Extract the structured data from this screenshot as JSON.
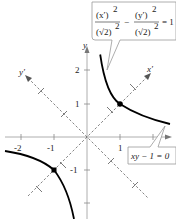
{
  "figure": {
    "type": "graph of rotated hyperbola",
    "axes": {
      "x_label": "x",
      "y_label": "y",
      "x_ticks": [
        "-2",
        "-1",
        "1",
        "2"
      ],
      "y_ticks": [
        "2",
        "1",
        "-1"
      ],
      "rotated_x_label": "x′",
      "rotated_y_label": "y′"
    },
    "callouts": {
      "top": {
        "num1": "(x′)",
        "num1_exp": "2",
        "den1": "(√2)",
        "den1_exp": "2",
        "minus": "−",
        "num2": "(y′)",
        "num2_exp": "2",
        "den2": "(√2)",
        "den2_exp": "2",
        "equals": "= 1"
      },
      "bottom": {
        "text": "xy − 1 = 0"
      }
    },
    "colors": {
      "curve": "#000000",
      "axis": "#999999",
      "rotated_axis": "#666666",
      "callout_border": "#999999"
    }
  }
}
